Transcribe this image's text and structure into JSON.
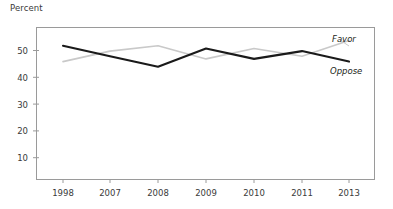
{
  "chart_data": {
    "type": "line",
    "title": "",
    "subtitle": "",
    "ylabel": "Percent",
    "xlabel": "",
    "categories": [
      "1998",
      "2007",
      "2008",
      "2009",
      "2010",
      "2011",
      "2013"
    ],
    "x": [
      1998,
      2007,
      2008,
      2009,
      2010,
      2011,
      2013
    ],
    "ylim": [
      0,
      58
    ],
    "yticks": [
      10,
      20,
      30,
      40,
      50
    ],
    "ytick_labels": [
      "10",
      "20",
      "30",
      "40",
      "50"
    ],
    "grid": false,
    "legend_position": "inline-right",
    "series": [
      {
        "name": "Favor",
        "color": "#c9c9c9",
        "values": [
          45,
          49,
          51,
          46,
          50,
          47,
          53
        ]
      },
      {
        "name": "Oppose",
        "color": "#1a1a1a",
        "values": [
          51,
          47,
          43,
          50,
          46,
          49,
          45
        ]
      }
    ],
    "annotations": [
      {
        "text": "Favor",
        "series": "Favor"
      },
      {
        "text": "Oppose",
        "series": "Oppose"
      }
    ]
  },
  "axis": {
    "y_label_text": "Percent",
    "y_ticks": [
      "10",
      "20",
      "30",
      "40",
      "50"
    ],
    "x_ticks": [
      "1998",
      "2007",
      "2008",
      "2009",
      "2010",
      "2011",
      "2013"
    ]
  },
  "legend": {
    "favor_label": "Favor",
    "oppose_label": "Oppose"
  },
  "colors": {
    "favor_line": "#c9c9c9",
    "oppose_line": "#1a1a1a",
    "frame": "#8a8a8a",
    "text": "#3a3a3a"
  }
}
